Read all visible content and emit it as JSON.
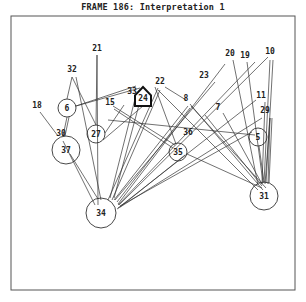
{
  "title": "FRAME 186: Interpretation 1",
  "frame": {
    "x": 11,
    "y": 16,
    "width": 284,
    "height": 274,
    "stroke": "#555555"
  },
  "colors": {
    "line": "#333333",
    "background": "#ffffff"
  },
  "nodes": [
    {
      "id": "6",
      "shape": "circle",
      "x": 67,
      "y": 108,
      "r": 9
    },
    {
      "id": "37",
      "shape": "circle",
      "x": 66,
      "y": 150,
      "r": 14
    },
    {
      "id": "27",
      "shape": "circle",
      "x": 96,
      "y": 134,
      "r": 9
    },
    {
      "id": "24",
      "shape": "house",
      "x": 143,
      "y": 98,
      "r": 8
    },
    {
      "id": "35",
      "shape": "circle",
      "x": 178,
      "y": 152,
      "r": 9
    },
    {
      "id": "5",
      "shape": "circle",
      "x": 258,
      "y": 137,
      "r": 9
    },
    {
      "id": "34",
      "shape": "circle",
      "x": 101,
      "y": 213,
      "r": 15
    },
    {
      "id": "31",
      "shape": "circle",
      "x": 264,
      "y": 196,
      "r": 14
    }
  ],
  "labels": [
    {
      "id": "21",
      "x": 97,
      "y": 51
    },
    {
      "id": "32",
      "x": 72,
      "y": 72
    },
    {
      "id": "18",
      "x": 37,
      "y": 108
    },
    {
      "id": "30",
      "x": 61,
      "y": 136
    },
    {
      "id": "15",
      "x": 110,
      "y": 105
    },
    {
      "id": "33",
      "x": 132,
      "y": 94
    },
    {
      "id": "22",
      "x": 160,
      "y": 84
    },
    {
      "id": "8",
      "x": 186,
      "y": 101
    },
    {
      "id": "7",
      "x": 218,
      "y": 110
    },
    {
      "id": "23",
      "x": 204,
      "y": 78
    },
    {
      "id": "36",
      "x": 188,
      "y": 135
    },
    {
      "id": "20",
      "x": 230,
      "y": 56
    },
    {
      "id": "19",
      "x": 245,
      "y": 58
    },
    {
      "id": "10",
      "x": 270,
      "y": 54
    },
    {
      "id": "11",
      "x": 261,
      "y": 98
    },
    {
      "id": "29",
      "x": 265,
      "y": 113
    }
  ],
  "edges": [
    [
      97,
      55,
      96,
      125
    ],
    [
      97,
      55,
      98,
      205
    ],
    [
      72,
      77,
      67,
      99
    ],
    [
      72,
      77,
      96,
      125
    ],
    [
      76,
      77,
      101,
      200
    ],
    [
      40,
      112,
      58,
      136
    ],
    [
      67,
      117,
      63,
      136
    ],
    [
      69,
      117,
      65,
      136
    ],
    [
      76,
      106,
      136,
      86
    ],
    [
      76,
      106,
      140,
      88
    ],
    [
      63,
      141,
      95,
      205
    ],
    [
      70,
      154,
      98,
      199
    ],
    [
      105,
      133,
      124,
      105
    ],
    [
      103,
      140,
      150,
      100
    ],
    [
      110,
      198,
      135,
      99
    ],
    [
      114,
      198,
      140,
      101
    ],
    [
      108,
      200,
      158,
      88
    ],
    [
      112,
      200,
      160,
      90
    ],
    [
      113,
      106,
      175,
      145
    ],
    [
      114,
      109,
      173,
      148
    ],
    [
      155,
      87,
      176,
      144
    ],
    [
      165,
      87,
      186,
      100
    ],
    [
      114,
      200,
      188,
      106
    ],
    [
      117,
      202,
      190,
      108
    ],
    [
      115,
      200,
      215,
      82
    ],
    [
      118,
      204,
      225,
      64
    ],
    [
      118,
      205,
      255,
      62
    ],
    [
      119,
      205,
      268,
      57
    ],
    [
      120,
      206,
      252,
      132
    ],
    [
      118,
      208,
      256,
      100
    ],
    [
      117,
      209,
      262,
      118
    ],
    [
      120,
      207,
      185,
      155
    ],
    [
      190,
      104,
      263,
      190
    ],
    [
      191,
      106,
      266,
      188
    ],
    [
      205,
      115,
      262,
      186
    ],
    [
      223,
      113,
      262,
      184
    ],
    [
      158,
      90,
      258,
      190
    ],
    [
      233,
      60,
      258,
      185
    ],
    [
      247,
      62,
      263,
      183
    ],
    [
      270,
      60,
      264,
      183
    ],
    [
      273,
      60,
      266,
      183
    ],
    [
      265,
      102,
      262,
      184
    ],
    [
      270,
      118,
      265,
      184
    ],
    [
      270,
      118,
      268,
      184
    ],
    [
      272,
      118,
      269,
      183
    ],
    [
      259,
      146,
      264,
      182
    ],
    [
      187,
      154,
      262,
      188
    ],
    [
      108,
      120,
      255,
      135
    ]
  ]
}
